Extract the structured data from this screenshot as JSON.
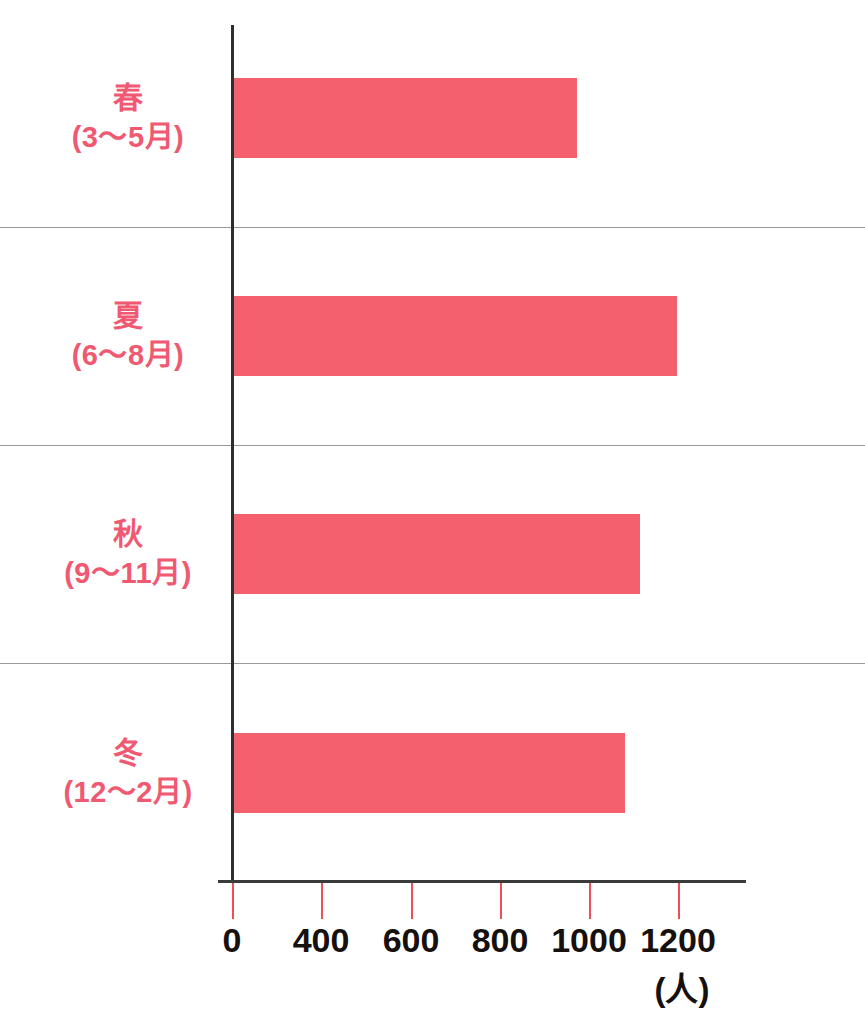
{
  "chart_data": {
    "type": "bar",
    "orientation": "horizontal",
    "title": "",
    "subtitle": "",
    "xlabel": "(人)",
    "ylabel": "",
    "categories": [
      "春\n(3～5月)",
      "夏\n(6～8月)",
      "秋\n(9～11月)",
      "冬\n(12～2月)"
    ],
    "values": [
      920,
      1130,
      1040,
      1020
    ],
    "series": [
      {
        "name": "",
        "values": [
          920,
          1130,
          1040,
          1020
        ]
      }
    ],
    "xlim": [
      0,
      1260
    ],
    "x_tick_labels": [
      "0",
      "400",
      "600",
      "800",
      "1000",
      "1200"
    ],
    "x_tick_values": [
      0,
      400,
      600,
      800,
      1000,
      1200
    ],
    "grid": false,
    "legend": "none",
    "bar_color": "#f4606e",
    "label_color": "#ef5971",
    "axis_color": "#2e2e2e",
    "tick_color": "#ef4f58"
  },
  "axis": {
    "unit_label": "(人)",
    "ticks": [
      {
        "label": "0",
        "value": 0,
        "x": 232
      },
      {
        "label": "400",
        "value": 400,
        "x": 321
      },
      {
        "label": "600",
        "value": 600,
        "x": 411
      },
      {
        "label": "800",
        "value": 800,
        "x": 500
      },
      {
        "label": "1000",
        "value": 1000,
        "x": 589
      },
      {
        "label": "1200",
        "value": 1200,
        "x": 678
      }
    ]
  },
  "rows": [
    {
      "season": "春",
      "months": "(3～5月)",
      "value": 920,
      "bar_top": 78,
      "bar_width": 345,
      "row_top": 0,
      "label_top": 78
    },
    {
      "season": "夏",
      "months": "(6～8月)",
      "value": 1130,
      "bar_top": 296,
      "bar_width": 445,
      "row_top": 228,
      "label_top": 296
    },
    {
      "season": "秋",
      "months": "(9～11月)",
      "value": 1040,
      "bar_top": 514,
      "bar_width": 408,
      "row_top": 446,
      "label_top": 514
    },
    {
      "season": "冬",
      "months": "(12～2月)",
      "value": 1020,
      "bar_top": 733,
      "bar_width": 393,
      "row_top": 664,
      "label_top": 733
    }
  ],
  "rules": [
    227,
    445,
    663
  ]
}
